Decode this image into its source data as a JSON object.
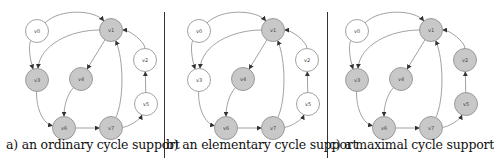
{
  "figure": {
    "panels": [
      {
        "id": "a",
        "caption": "a) an ordinary cycle support",
        "offset_x": 0,
        "nodes": [
          {
            "label": "v0",
            "x": 37,
            "y": 31,
            "filled": false
          },
          {
            "label": "v1",
            "x": 111,
            "y": 30,
            "filled": true
          },
          {
            "label": "v2",
            "x": 145,
            "y": 60,
            "filled": false
          },
          {
            "label": "v3",
            "x": 37,
            "y": 80,
            "filled": true
          },
          {
            "label": "v4",
            "x": 81,
            "y": 79,
            "filled": true
          },
          {
            "label": "v5",
            "x": 146,
            "y": 104,
            "filled": false
          },
          {
            "label": "v6",
            "x": 64,
            "y": 128,
            "filled": true
          },
          {
            "label": "v7",
            "x": 111,
            "y": 128,
            "filled": true
          }
        ]
      },
      {
        "id": "b",
        "caption": "b) an elementary cycle support",
        "offset_x": 162,
        "nodes": [
          {
            "label": "v0",
            "x": 37,
            "y": 31,
            "filled": false
          },
          {
            "label": "v1",
            "x": 111,
            "y": 30,
            "filled": true
          },
          {
            "label": "v2",
            "x": 145,
            "y": 60,
            "filled": false
          },
          {
            "label": "v3",
            "x": 37,
            "y": 80,
            "filled": false
          },
          {
            "label": "v4",
            "x": 81,
            "y": 79,
            "filled": true
          },
          {
            "label": "v5",
            "x": 146,
            "y": 104,
            "filled": false
          },
          {
            "label": "v6",
            "x": 64,
            "y": 128,
            "filled": true
          },
          {
            "label": "v7",
            "x": 111,
            "y": 128,
            "filled": true
          }
        ]
      },
      {
        "id": "c",
        "caption": "c) a maximal cycle support",
        "offset_x": 320,
        "nodes": [
          {
            "label": "v0",
            "x": 37,
            "y": 31,
            "filled": false
          },
          {
            "label": "v1",
            "x": 111,
            "y": 30,
            "filled": true
          },
          {
            "label": "v2",
            "x": 145,
            "y": 60,
            "filled": true
          },
          {
            "label": "v3",
            "x": 37,
            "y": 80,
            "filled": true
          },
          {
            "label": "v4",
            "x": 81,
            "y": 79,
            "filled": true
          },
          {
            "label": "v5",
            "x": 146,
            "y": 104,
            "filled": true
          },
          {
            "label": "v6",
            "x": 64,
            "y": 128,
            "filled": true
          },
          {
            "label": "v7",
            "x": 111,
            "y": 128,
            "filled": true
          }
        ]
      }
    ],
    "edges": [
      {
        "from": "v0",
        "to": "v1"
      },
      {
        "from": "v0",
        "to": "v3"
      },
      {
        "from": "v1",
        "to": "v3"
      },
      {
        "from": "v1",
        "to": "v4"
      },
      {
        "from": "v3",
        "to": "v6"
      },
      {
        "from": "v4",
        "to": "v6"
      },
      {
        "from": "v6",
        "to": "v7"
      },
      {
        "from": "v7",
        "to": "v1"
      },
      {
        "from": "v7",
        "to": "v5"
      },
      {
        "from": "v5",
        "to": "v2"
      },
      {
        "from": "v2",
        "to": "v1"
      }
    ],
    "colors": {
      "node_fill": "#c8c8c8",
      "node_empty": "#ffffff",
      "node_stroke": "#8a8a8a",
      "edge": "#8a8a8a",
      "divider": "#333333"
    }
  }
}
